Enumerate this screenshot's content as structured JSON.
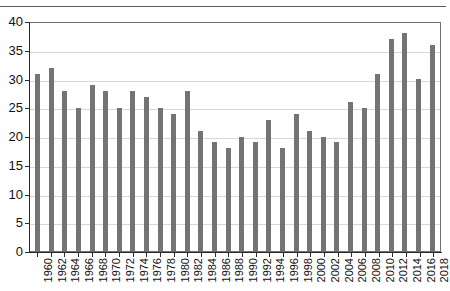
{
  "caption": {
    "text": "",
    "visible_fragment": ""
  },
  "chart_data": {
    "type": "bar",
    "title": "",
    "xlabel": "",
    "ylabel": "",
    "ylim": [
      0,
      40
    ],
    "yticks": [
      0,
      5,
      10,
      15,
      20,
      25,
      30,
      35,
      40
    ],
    "ytick_labels": [
      "0",
      "5",
      "10",
      "15",
      "20",
      "25",
      "30",
      "35",
      "40"
    ],
    "grid": true,
    "legend": null,
    "bar_color": "#747474",
    "categories": [
      "1960",
      "1962",
      "1964",
      "1966",
      "1968",
      "1970",
      "1972",
      "1974",
      "1976",
      "1978",
      "1980",
      "1982",
      "1984",
      "1986",
      "1988",
      "1990",
      "1992",
      "1994",
      "1996",
      "1998",
      "2000",
      "2002",
      "2004",
      "2006",
      "2008",
      "2010",
      "2012",
      "2014",
      "2016",
      "2018"
    ],
    "values": [
      30.8,
      31.9,
      27.9,
      24.9,
      28.9,
      27.9,
      24.9,
      27.9,
      26.8,
      24.9,
      23.9,
      27.9,
      20.8,
      18.9,
      17.9,
      19.8,
      18.9,
      22.8,
      17.9,
      23.9,
      20.8,
      19.8,
      18.9,
      25.9,
      24.9,
      30.8,
      36.9,
      37.9,
      29.9,
      35.9
    ]
  }
}
